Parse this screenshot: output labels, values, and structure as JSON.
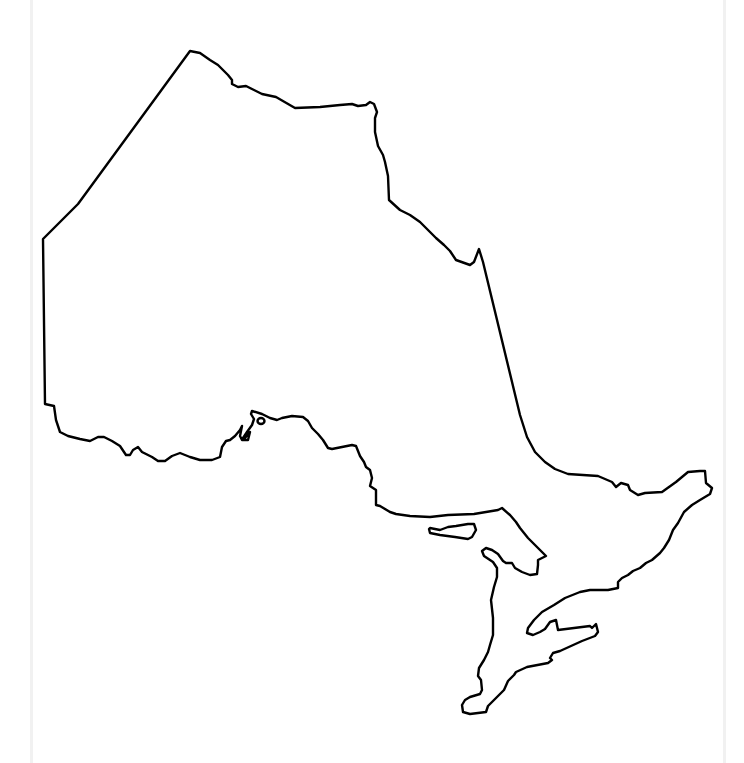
{
  "map": {
    "title": "",
    "region": "Ontario",
    "style": "blank outline",
    "stroke_color": "#000000",
    "fill_color": "#ffffff",
    "background_color": "#ffffff",
    "page_edge_color": "#f1f1f1"
  }
}
